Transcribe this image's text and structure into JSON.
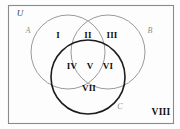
{
  "figure": {
    "type": "venn-diagram-3-set",
    "background_color": "#fdfdfd",
    "universe": {
      "label": "U",
      "border_color": "#8a8a8a",
      "border_width": 1.1,
      "x": 8,
      "y": 5,
      "width": 166,
      "height": 119
    },
    "sets": [
      {
        "name": "A",
        "label": "A",
        "cx": 68,
        "cy": 52,
        "r": 37,
        "stroke": "#9a9a9a",
        "stroke_width": 1.0,
        "label_x": 28,
        "label_y": 31
      },
      {
        "name": "B",
        "label": "B",
        "cx": 108,
        "cy": 52,
        "r": 37,
        "stroke": "#9a9a9a",
        "stroke_width": 1.0,
        "label_x": 150,
        "label_y": 31
      },
      {
        "name": "C",
        "label": "C",
        "cx": 88,
        "cy": 77,
        "r": 37,
        "stroke": "#1c1c1c",
        "stroke_width": 1.6,
        "label_x": 120,
        "label_y": 107
      }
    ],
    "regions": [
      {
        "id": "region-1",
        "label": "I",
        "x": 58,
        "y": 36,
        "meaning": "A only"
      },
      {
        "id": "region-2",
        "label": "II",
        "x": 88,
        "y": 36,
        "meaning": "A and B only"
      },
      {
        "id": "region-3",
        "label": "III",
        "x": 112,
        "y": 36,
        "meaning": "B only"
      },
      {
        "id": "region-4",
        "label": "IV",
        "x": 72,
        "y": 67,
        "meaning": "A and C only"
      },
      {
        "id": "region-5",
        "label": "V",
        "x": 90,
        "y": 67,
        "meaning": "A and B and C"
      },
      {
        "id": "region-6",
        "label": "VI",
        "x": 108,
        "y": 67,
        "meaning": "B and C only"
      },
      {
        "id": "region-7",
        "label": "VII",
        "x": 89,
        "y": 89,
        "meaning": "C only"
      },
      {
        "id": "region-8",
        "label": "VIII",
        "x": 161,
        "y": 113,
        "meaning": "outside all sets"
      }
    ]
  }
}
